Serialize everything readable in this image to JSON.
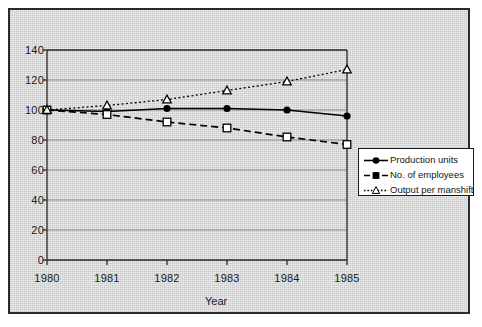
{
  "chart_data": {
    "type": "line",
    "title": "",
    "subtitle": "",
    "xlabel": "Year",
    "ylabel": "",
    "categories": [
      "1980",
      "1981",
      "1982",
      "1983",
      "1984",
      "1985"
    ],
    "x": [
      1980,
      1981,
      1982,
      1983,
      1984,
      1985
    ],
    "xlim": [
      1980,
      1985
    ],
    "ylim": [
      0,
      140
    ],
    "ytick_values": [
      0,
      20,
      40,
      60,
      80,
      100,
      120,
      140
    ],
    "ytick_labels": [
      "0",
      "20",
      "40",
      "60",
      "80",
      "100",
      "120",
      "140"
    ],
    "xtick_labels": [
      "1980",
      "1981",
      "1982",
      "1983",
      "1984",
      "1985"
    ],
    "grid": "horizontal",
    "legend_position": "right-middle",
    "series": [
      {
        "name": "Production units",
        "values": [
          100,
          99,
          101,
          101,
          100,
          96
        ],
        "marker": "filled-circle",
        "linestyle": "solid",
        "color": "#000000"
      },
      {
        "name": "No. of employees",
        "values": [
          100,
          97,
          92,
          88,
          82,
          77
        ],
        "marker": "open-square",
        "linestyle": "dashed",
        "color": "#000000"
      },
      {
        "name": "Output per manshift",
        "values": [
          100,
          103,
          107,
          113,
          119,
          127
        ],
        "marker": "open-triangle",
        "linestyle": "dotted",
        "color": "#000000"
      }
    ]
  },
  "legend": {
    "items": [
      {
        "label": "Production units"
      },
      {
        "label": "No. of employees"
      },
      {
        "label": "Output per manshift"
      }
    ]
  },
  "axes": {
    "x_title": "Year"
  },
  "colors": {
    "background": "#eeeeee",
    "frame": "#2b2b2b",
    "line": "#000000",
    "grid": "#8a8a8a",
    "legend_background": "#ffffff"
  }
}
